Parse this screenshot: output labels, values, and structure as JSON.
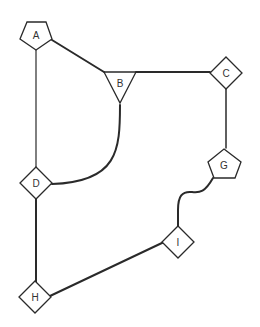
{
  "diagram": {
    "type": "graph",
    "nodes": [
      {
        "id": "A",
        "label": "A",
        "shape": "pentagon"
      },
      {
        "id": "B",
        "label": "B",
        "shape": "triangle"
      },
      {
        "id": "C",
        "label": "C",
        "shape": "diamond"
      },
      {
        "id": "D",
        "label": "D",
        "shape": "diamond"
      },
      {
        "id": "G",
        "label": "G",
        "shape": "pentagon"
      },
      {
        "id": "H",
        "label": "H",
        "shape": "diamond"
      },
      {
        "id": "I",
        "label": "I",
        "shape": "diamond"
      }
    ],
    "edges": [
      {
        "from": "A",
        "to": "B",
        "style": "straight"
      },
      {
        "from": "A",
        "to": "D",
        "style": "straight"
      },
      {
        "from": "B",
        "to": "C",
        "style": "straight"
      },
      {
        "from": "B",
        "to": "D",
        "style": "curved"
      },
      {
        "from": "C",
        "to": "G",
        "style": "straight"
      },
      {
        "from": "G",
        "to": "I",
        "style": "wavy"
      },
      {
        "from": "D",
        "to": "H",
        "style": "straight"
      },
      {
        "from": "H",
        "to": "I",
        "style": "straight"
      }
    ]
  }
}
